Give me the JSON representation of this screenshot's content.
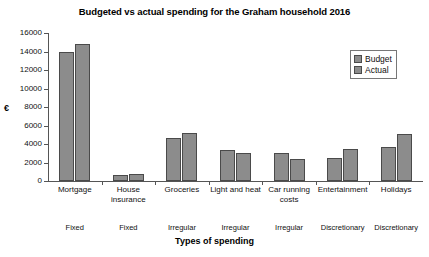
{
  "chart_data": {
    "type": "bar",
    "title": "Budgeted vs actual spending for the Graham household 2016",
    "xlabel": "Types of spending",
    "ylabel": "€",
    "ylim": [
      0,
      16000
    ],
    "ytick_step": 2000,
    "yticks": [
      "16000",
      "14000",
      "12000",
      "10000",
      "8000",
      "6000",
      "4000",
      "2000",
      "0"
    ],
    "grid": false,
    "legend_position": "top-right",
    "categories": [
      "Mortgage",
      "House insurance",
      "Groceries",
      "Light and heat",
      "Car running costs",
      "Entertainment",
      "Holidays"
    ],
    "category_types": [
      "Fixed",
      "Fixed",
      "Irregular",
      "Irregular",
      "Irregular",
      "Discretionary",
      "Discretionary"
    ],
    "series": [
      {
        "name": "Budget",
        "values": [
          14000,
          700,
          4600,
          3300,
          3000,
          2500,
          3700
        ]
      },
      {
        "name": "Actual",
        "values": [
          14800,
          800,
          5200,
          3000,
          2400,
          3500,
          5100
        ]
      }
    ],
    "colors": {
      "bar_fill": "#8c8c8c",
      "bar_stroke": "#4a4a4a",
      "axis": "#555555",
      "text": "#111111",
      "background": "#ffffff"
    }
  }
}
